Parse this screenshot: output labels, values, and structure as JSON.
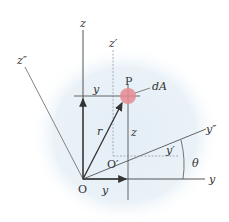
{
  "diagram": {
    "colors": {
      "background_blob": "#e8f0f6",
      "line": "#555555",
      "dashed": "#9aa0a6",
      "dA_fill": "#e58a92",
      "text": "#333333"
    },
    "labels": {
      "z": "z",
      "z_prime": "z′",
      "z_double_prime": "z″",
      "y_axis": "y",
      "y_prime": "y′",
      "y_double_prime": "y″",
      "y_top": "y",
      "y_bottom": "y",
      "z_segment": "z",
      "r": "r",
      "P": "P",
      "dA": "dA",
      "O": "O",
      "O_prime": "O′",
      "theta": "θ"
    }
  }
}
